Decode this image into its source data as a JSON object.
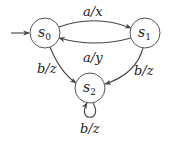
{
  "diagram": {
    "type": "finite-state-machine",
    "states": [
      {
        "id": "s0",
        "name": "s",
        "subscript": "0",
        "initial": true
      },
      {
        "id": "s1",
        "name": "s",
        "subscript": "1",
        "initial": false
      },
      {
        "id": "s2",
        "name": "s",
        "subscript": "2",
        "initial": false
      }
    ],
    "transitions": [
      {
        "from": "s0",
        "to": "s1",
        "label": "a/x"
      },
      {
        "from": "s1",
        "to": "s0",
        "label": "a/y"
      },
      {
        "from": "s0",
        "to": "s2",
        "label": "b/z"
      },
      {
        "from": "s1",
        "to": "s2",
        "label": "b/z"
      },
      {
        "from": "s2",
        "to": "s2",
        "label": "b/z"
      }
    ]
  },
  "colors": {
    "stroke": "#444444",
    "text": "#222222",
    "background": "#ffffff"
  }
}
